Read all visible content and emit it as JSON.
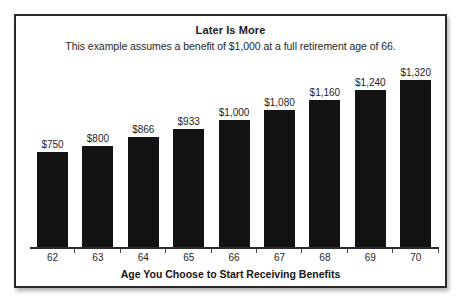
{
  "chart_data": {
    "type": "bar",
    "title": "Later Is More",
    "subtitle": "This example assumes a benefit of $1,000 at a full retirement age of 66.",
    "xlabel": "Age You Choose to Start Receiving Benefits",
    "ylabel": "",
    "grid": false,
    "legend": "none",
    "ylim": [
      0,
      1320
    ],
    "categories": [
      "62",
      "63",
      "64",
      "65",
      "66",
      "67",
      "68",
      "69",
      "70"
    ],
    "values": [
      750,
      800,
      866,
      933,
      1000,
      1080,
      1160,
      1240,
      1320
    ],
    "value_labels": [
      "$750",
      "$800",
      "$866",
      "$933",
      "$1,000",
      "$1,080",
      "$1,160",
      "$1,240",
      "$1,320"
    ],
    "bar_color": "#131313",
    "background_color": "#ffffff",
    "frame_color": "#2b2b2b"
  },
  "caption_sliver": ""
}
